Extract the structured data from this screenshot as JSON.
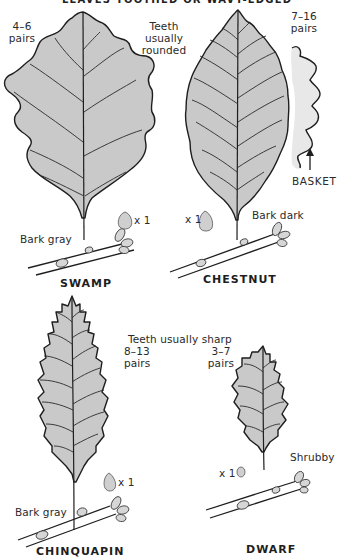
{
  "header": {
    "title": "LEAVES TOOTHED OR WAVY-EDGED"
  },
  "groups": [
    {
      "caption": "Teeth usually rounded"
    },
    {
      "caption": "Teeth usually sharp"
    }
  ],
  "species": [
    {
      "name": "SWAMP",
      "teeth_pairs": "4–6",
      "pairs_label": "pairs",
      "bark": "Bark gray",
      "acorn_scale": "x 1"
    },
    {
      "name": "CHESTNUT",
      "bark": "Bark dark",
      "acorn_scale": "x 1",
      "variant": {
        "teeth_pairs": "7–16",
        "pairs_label": "pairs",
        "name": "BASKET",
        "arrow": "↑"
      }
    },
    {
      "name": "CHINQUAPIN",
      "teeth_pairs": "8–13",
      "pairs_label": "pairs",
      "bark": "Bark gray",
      "acorn_scale": "x 1"
    },
    {
      "name": "DWARF",
      "teeth_pairs": "3–7",
      "pairs_label": "pairs",
      "habit": "Shrubby",
      "acorn_scale": "x 1"
    }
  ],
  "colors": {
    "leaf_fill": "#c9c9c9",
    "outline": "#1e1e1e",
    "background": "#ffffff"
  }
}
